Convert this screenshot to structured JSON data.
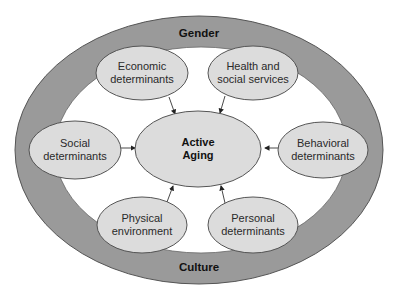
{
  "ring": {
    "top_label": "Gender",
    "bottom_label": "Culture",
    "color": "#9a9a9a"
  },
  "center": {
    "line1": "Active",
    "line2": "Aging",
    "fill": "#dcdcdc"
  },
  "nodes": [
    {
      "id": "economic",
      "line1": "Economic",
      "line2": "determinants"
    },
    {
      "id": "health",
      "line1": "Health and",
      "line2": "social services"
    },
    {
      "id": "social",
      "line1": "Social",
      "line2": "determinants"
    },
    {
      "id": "behavioral",
      "line1": "Behavioral",
      "line2": "determinants"
    },
    {
      "id": "physical",
      "line1": "Physical",
      "line2": "environment"
    },
    {
      "id": "personal",
      "line1": "Personal",
      "line2": "determinants"
    }
  ]
}
